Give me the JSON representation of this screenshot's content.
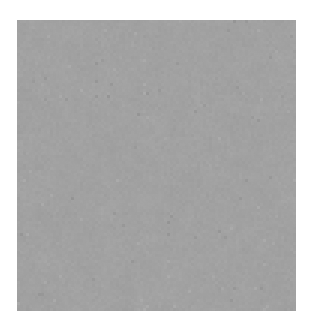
{
  "page": {
    "width": 313,
    "height": 326,
    "background_color": "#ffffff"
  },
  "caption": {
    "note": "clipped text line at top edge, only bottom sliver of glyphs visible, illegible",
    "left_fragment": "         ",
    "right_fragment": "       ",
    "color": "#b9b9b9"
  },
  "figure": {
    "label": "grayscale-noise-texture",
    "x": 17,
    "y": 20,
    "width": 279,
    "height": 291,
    "mean_gray": "#a3a3a3",
    "dark_extreme": "#2b2b2b",
    "light_extreme": "#f2f2f2",
    "border_color": "none"
  },
  "chart_data": {
    "type": "heatmap",
    "title": "",
    "xlabel": "",
    "ylabel": "",
    "grid": false,
    "legend": "none",
    "colormap": "grayscale",
    "value_range": [
      0,
      255
    ],
    "mean_value": 163,
    "cell_size_px": 3,
    "cols": 93,
    "rows": 97
  }
}
